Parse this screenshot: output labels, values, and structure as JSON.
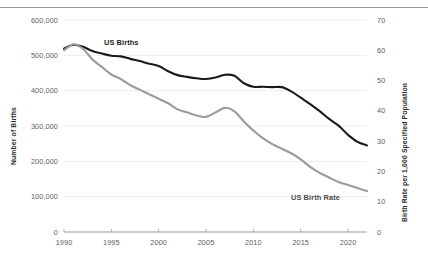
{
  "chart_data": {
    "type": "line",
    "title": "",
    "xlabel": "",
    "grid": "horizontal",
    "legend_position": "inline-labels",
    "x": [
      1990,
      1991,
      1992,
      1993,
      1994,
      1995,
      1996,
      1997,
      1998,
      1999,
      2000,
      2001,
      2002,
      2003,
      2004,
      2005,
      2006,
      2007,
      2008,
      2009,
      2010,
      2011,
      2012,
      2013,
      2014,
      2015,
      2016,
      2017,
      2018,
      2019,
      2020,
      2021,
      2022
    ],
    "x_ticks": [
      "1990",
      "1995",
      "2000",
      "2005",
      "2010",
      "2015",
      "2020"
    ],
    "axes": {
      "left": {
        "label": "Number of Births",
        "ticks": [
          "0",
          "100,000",
          "200,000",
          "300,000",
          "400,000",
          "500,000",
          "600,000"
        ],
        "min": 0,
        "max": 600000,
        "step": 100000
      },
      "right": {
        "label": "Birth Rate per 1,000 Specified Population",
        "ticks": [
          "0",
          "10",
          "20",
          "30",
          "40",
          "50",
          "60",
          "70"
        ],
        "min": 0,
        "max": 70,
        "step": 10
      }
    },
    "series": [
      {
        "name": "US Births",
        "axis": "left",
        "color": "#1a1a1a",
        "label_text": "US Births",
        "values": [
          519000,
          530000,
          524000,
          512000,
          505000,
          499000,
          497000,
          490000,
          484000,
          476000,
          470000,
          455000,
          444000,
          439000,
          435000,
          433000,
          437000,
          445000,
          442000,
          421000,
          411000,
          411000,
          410000,
          410000,
          398000,
          380000,
          362000,
          342000,
          320000,
          301000,
          275000,
          255000,
          245000
        ]
      },
      {
        "name": "US Birth Rate",
        "axis": "right",
        "color": "#9b9b9b",
        "label_text": "US Birth Rate",
        "values": [
          60.0,
          62.0,
          60.5,
          57.0,
          54.5,
          52.0,
          50.5,
          48.5,
          47.0,
          45.5,
          44.0,
          42.5,
          40.5,
          39.5,
          38.5,
          38.0,
          39.5,
          41.0,
          39.8,
          36.5,
          33.5,
          31.0,
          29.0,
          27.5,
          26.0,
          24.0,
          21.5,
          19.5,
          18.0,
          16.5,
          15.5,
          14.5,
          13.5
        ]
      }
    ],
    "annotations": [
      {
        "name": "us-births-series-label",
        "text": "US Births"
      },
      {
        "name": "us-birth-rate-series-label",
        "text": "US Birth Rate"
      }
    ]
  }
}
